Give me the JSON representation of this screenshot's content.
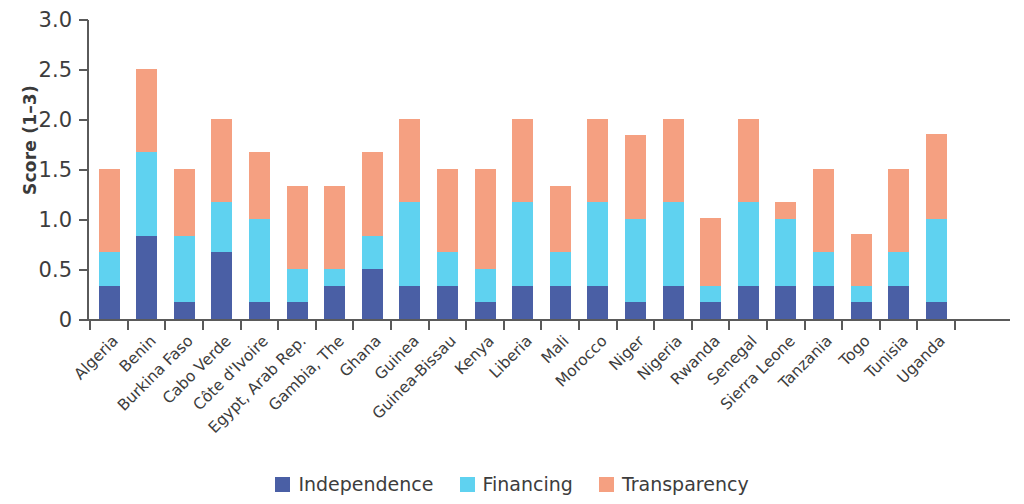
{
  "chart_data": {
    "type": "bar",
    "subtype": "stacked-vertical",
    "title": "",
    "xlabel": "",
    "ylabel": "Score (1–3)",
    "ylim": [
      0,
      3.0
    ],
    "ytick_labels": [
      "0",
      "0.5",
      "1.0",
      "1.5",
      "2.0",
      "2.5",
      "3.0"
    ],
    "ytick_values": [
      0,
      0.5,
      1.0,
      1.5,
      2.0,
      2.5,
      3.0
    ],
    "grid": false,
    "legend_position": "bottom-center",
    "categories": [
      "Algeria",
      "Benin",
      "Burkina Faso",
      "Cabo Verde",
      "Côte d'Ivoire",
      "Egypt, Arab Rep.",
      "Gambia, The",
      "Ghana",
      "Guinea",
      "Guinea-Bissau",
      "Kenya",
      "Liberia",
      "Mali",
      "Morocco",
      "Niger",
      "Nigeria",
      "Rwanda",
      "Senegal",
      "Sierra Leone",
      "Tanzania",
      "Togo",
      "Tunisia",
      "Uganda"
    ],
    "series": [
      {
        "name": "Independence",
        "color": "#4a5fa5",
        "values": [
          0.33,
          0.83,
          0.17,
          0.67,
          0.17,
          0.17,
          0.33,
          0.5,
          0.33,
          0.33,
          0.17,
          0.33,
          0.33,
          0.33,
          0.17,
          0.33,
          0.17,
          0.33,
          0.33,
          0.33,
          0.17,
          0.33,
          0.17
        ]
      },
      {
        "name": "Financing",
        "color": "#5fd2f0",
        "values": [
          0.34,
          0.84,
          0.66,
          0.5,
          0.83,
          0.33,
          0.17,
          0.33,
          0.84,
          0.34,
          0.33,
          0.84,
          0.34,
          0.84,
          0.83,
          0.84,
          0.16,
          0.84,
          0.67,
          0.34,
          0.16,
          0.34,
          0.83
        ]
      },
      {
        "name": "Transparency",
        "color": "#f5a081",
        "values": [
          0.83,
          0.83,
          0.67,
          0.83,
          0.67,
          0.83,
          0.83,
          0.84,
          0.83,
          0.83,
          1.0,
          0.83,
          0.66,
          0.83,
          0.84,
          0.83,
          0.68,
          0.83,
          0.17,
          0.83,
          0.52,
          0.83,
          0.85
        ]
      }
    ],
    "totals": [
      1.5,
      2.5,
      1.5,
      2.0,
      1.67,
      1.33,
      1.33,
      1.67,
      2.0,
      1.5,
      1.5,
      2.0,
      1.33,
      2.0,
      1.84,
      2.0,
      1.01,
      2.0,
      1.17,
      1.5,
      0.85,
      1.5,
      1.85
    ]
  },
  "legend": {
    "items": [
      {
        "label": "Independence",
        "color": "#4a5fa5",
        "swatch": "square-swatch"
      },
      {
        "label": "Financing",
        "color": "#5fd2f0",
        "swatch": "square-swatch"
      },
      {
        "label": "Transparency",
        "color": "#f5a081",
        "swatch": "square-swatch"
      }
    ]
  },
  "colors": {
    "independence": "#4a5fa5",
    "financing": "#5fd2f0",
    "transparency": "#f5a081",
    "axis": "#5a5a5a",
    "text": "#3d3d3d",
    "background": "#ffffff"
  }
}
